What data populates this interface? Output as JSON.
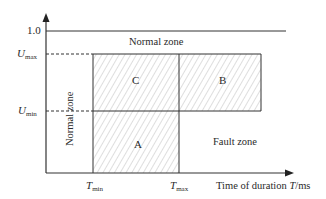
{
  "diagram": {
    "type": "zone-diagram",
    "y_axis": {
      "ticks": [
        {
          "id": "one",
          "label": "1.0"
        },
        {
          "id": "umax",
          "symbol": "U",
          "subscript": "max"
        },
        {
          "id": "umin",
          "symbol": "U",
          "subscript": "min"
        }
      ]
    },
    "x_axis": {
      "label_prefix": "Time of duration ",
      "label_symbol": "T",
      "label_unit": "/ms",
      "ticks": [
        {
          "id": "tmin",
          "symbol": "T",
          "subscript": "min"
        },
        {
          "id": "tmax",
          "symbol": "T",
          "subscript": "max"
        }
      ]
    },
    "zones": {
      "normal_top": "Normal zone",
      "normal_left": "Normal zone",
      "fault": "Fault zone"
    },
    "regions": {
      "a": "A",
      "b": "B",
      "c": "C"
    },
    "colors": {
      "line": "#333333",
      "hatch": "#b8b8b8",
      "text": "#2a2a2a"
    }
  }
}
